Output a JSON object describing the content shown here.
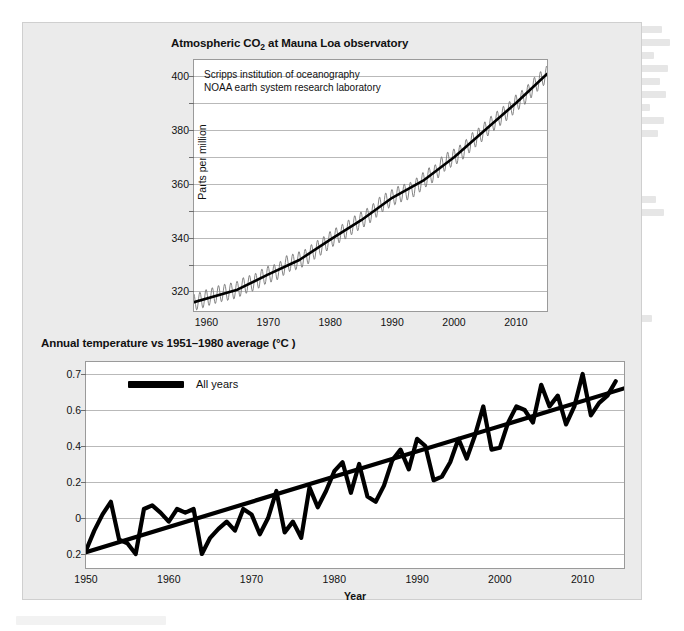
{
  "figure": {
    "background_color": "#ebebeb",
    "panel_border_color": "#cfcfcf"
  },
  "charts": {
    "co2": {
      "title_main": "Atmospheric CO",
      "title_sub": "2",
      "title_rest": " at Mauna Loa observatory",
      "source_line_1": "Scripps institution of oceanography",
      "source_line_2": "NOAA earth system research laboratory",
      "ylabel": "Parts per million",
      "yticks": [
        "400",
        "380",
        "360",
        "340",
        "320"
      ],
      "xticks": [
        "1960",
        "1970",
        "1980",
        "1990",
        "2000",
        "2010"
      ]
    },
    "temperature": {
      "title": "Annual temperature vs 1951–1980 average (°C )",
      "legend_label": "All years",
      "xlabel": "Year",
      "yticks": [
        "0.7",
        "0.6",
        "0.4",
        "0.2",
        "0",
        "0.2"
      ],
      "xticks": [
        "1950",
        "1960",
        "1970",
        "1980",
        "1990",
        "2000",
        "2010"
      ]
    }
  },
  "chart_data": [
    {
      "type": "line",
      "id": "mauna-loa-co2",
      "title": "Atmospheric CO2 at Mauna Loa observatory",
      "xlabel": "",
      "ylabel": "Parts per million",
      "xlim": [
        1958,
        2015
      ],
      "ylim": [
        312,
        406
      ],
      "ytick_values": [
        320,
        340,
        360,
        380,
        400
      ],
      "ytick_minor_step": 10,
      "xtick_values": [
        1960,
        1970,
        1980,
        1990,
        2000,
        2010
      ],
      "grid": true,
      "legend_position": "inside-top-left",
      "annotations": [
        "Scripps institution of oceanography",
        "NOAA earth system research laboratory"
      ],
      "series": [
        {
          "name": "Monthly mean CO2 (seasonal sawtooth)",
          "color": "#777777",
          "style": "thin-oscillating",
          "seasonal_amplitude_ppm": 3.2,
          "x": [
            1958,
            1959,
            1960,
            1961,
            1962,
            1963,
            1964,
            1965,
            1966,
            1967,
            1968,
            1969,
            1970,
            1971,
            1972,
            1973,
            1974,
            1975,
            1976,
            1977,
            1978,
            1979,
            1980,
            1981,
            1982,
            1983,
            1984,
            1985,
            1986,
            1987,
            1988,
            1989,
            1990,
            1991,
            1992,
            1993,
            1994,
            1995,
            1996,
            1997,
            1998,
            1999,
            2000,
            2001,
            2002,
            2003,
            2004,
            2005,
            2006,
            2007,
            2008,
            2009,
            2010,
            2011,
            2012,
            2013,
            2014,
            2015
          ],
          "values": [
            315.3,
            315.9,
            316.9,
            317.6,
            318.4,
            318.9,
            319.4,
            320.0,
            321.4,
            322.2,
            323.0,
            324.6,
            325.7,
            326.3,
            327.5,
            329.7,
            330.2,
            331.1,
            332.0,
            333.8,
            335.4,
            336.8,
            338.7,
            340.1,
            341.4,
            343.0,
            344.6,
            346.0,
            347.4,
            349.2,
            351.6,
            353.1,
            354.4,
            355.6,
            356.4,
            357.1,
            358.8,
            360.8,
            362.6,
            363.7,
            366.7,
            368.4,
            369.6,
            371.1,
            373.2,
            375.8,
            377.5,
            379.8,
            381.9,
            383.8,
            385.6,
            387.4,
            389.9,
            391.6,
            393.8,
            396.5,
            398.6,
            400.8
          ]
        },
        {
          "name": "Smoothed trend",
          "color": "#000000",
          "style": "thick-smooth",
          "x": [
            1958,
            1965,
            1970,
            1975,
            1980,
            1985,
            1990,
            1995,
            2000,
            2005,
            2010,
            2015
          ],
          "values": [
            315.3,
            320.0,
            325.7,
            331.1,
            338.7,
            346.0,
            354.4,
            360.8,
            369.6,
            379.8,
            389.9,
            400.8
          ]
        }
      ]
    },
    {
      "type": "line",
      "id": "global-temperature-anomaly",
      "title": "Annual temperature vs 1951-1980 average (°C )",
      "xlabel": "Year",
      "ylabel": "",
      "xlim": [
        1950,
        2015
      ],
      "ylim": [
        -0.3,
        0.75
      ],
      "ytick_values": [
        0.7,
        0.6,
        0.4,
        0.2,
        0,
        -0.2
      ],
      "ytick_labels_as_shown": [
        "0.7",
        "0.6",
        "0.4",
        "0.2",
        "0",
        "0.2"
      ],
      "xtick_values": [
        1950,
        1960,
        1970,
        1980,
        1990,
        2000,
        2010
      ],
      "grid": true,
      "legend_position": "inside-top-left",
      "series": [
        {
          "name": "All years",
          "color": "#000000",
          "style": "thick-jagged",
          "x": [
            1950,
            1951,
            1952,
            1953,
            1954,
            1955,
            1956,
            1957,
            1958,
            1959,
            1960,
            1961,
            1962,
            1963,
            1964,
            1965,
            1966,
            1967,
            1968,
            1969,
            1970,
            1971,
            1972,
            1973,
            1974,
            1975,
            1976,
            1977,
            1978,
            1979,
            1980,
            1981,
            1982,
            1983,
            1984,
            1985,
            1986,
            1987,
            1988,
            1989,
            1990,
            1991,
            1992,
            1993,
            1994,
            1995,
            1996,
            1997,
            1998,
            1999,
            2000,
            2001,
            2002,
            2003,
            2004,
            2005,
            2006,
            2007,
            2008,
            2009,
            2010,
            2011,
            2012,
            2013,
            2014
          ],
          "values": [
            -0.18,
            -0.07,
            0.02,
            0.09,
            -0.12,
            -0.14,
            -0.2,
            0.05,
            0.07,
            0.03,
            -0.02,
            0.05,
            0.03,
            0.05,
            -0.2,
            -0.11,
            -0.06,
            -0.02,
            -0.07,
            0.05,
            0.02,
            -0.09,
            0.0,
            0.15,
            -0.08,
            -0.02,
            -0.11,
            0.17,
            0.06,
            0.15,
            0.26,
            0.31,
            0.14,
            0.3,
            0.12,
            0.09,
            0.18,
            0.32,
            0.38,
            0.27,
            0.44,
            0.4,
            0.21,
            0.23,
            0.31,
            0.44,
            0.33,
            0.46,
            0.61,
            0.38,
            0.39,
            0.53,
            0.61,
            0.6,
            0.53,
            0.67,
            0.61,
            0.64,
            0.52,
            0.61,
            0.7,
            0.57,
            0.62,
            0.64,
            0.68
          ]
        },
        {
          "name": "Linear trend",
          "color": "#000000",
          "style": "thick-straight",
          "x": [
            1950,
            2015
          ],
          "values": [
            -0.19,
            0.66
          ]
        }
      ]
    }
  ]
}
